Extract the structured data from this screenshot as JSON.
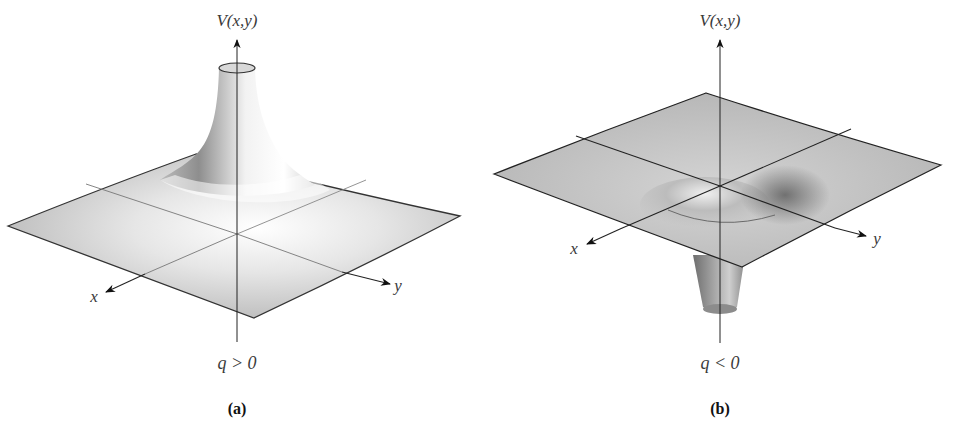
{
  "figure": {
    "panels": [
      {
        "id": "a",
        "caption": "(a)",
        "vertical_axis_label": "V(x,y)",
        "x_axis_label": "x",
        "y_axis_label": "y",
        "condition": "q > 0",
        "surface": "peak"
      },
      {
        "id": "b",
        "caption": "(b)",
        "vertical_axis_label": "V(x,y)",
        "x_axis_label": "x",
        "y_axis_label": "y",
        "condition": "q < 0",
        "surface": "well"
      }
    ],
    "colors": {
      "plane_fill": "#bdbdbd",
      "plane_edge": "#333333",
      "highlight": "#ffffff",
      "axis": "#222222"
    }
  }
}
